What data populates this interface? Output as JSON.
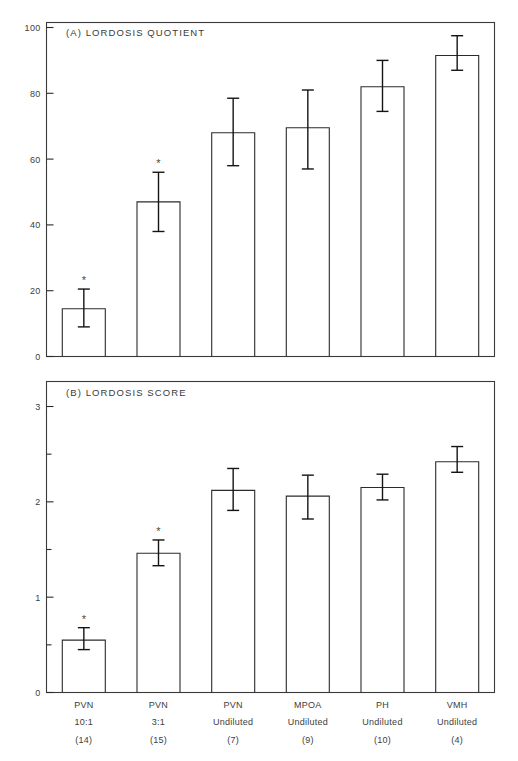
{
  "figure": {
    "background": "#ffffff",
    "ink_color": "#2b2b2b"
  },
  "chart_data": [
    {
      "type": "bar",
      "panel": "A",
      "title": "(A) LORDOSIS QUOTIENT",
      "xlabel": "",
      "ylabel": "",
      "ylim": [
        0,
        105
      ],
      "yticks": [
        0,
        20,
        40,
        60,
        80,
        100
      ],
      "ytick_labels": [
        "0",
        "20",
        "40",
        "60",
        "80",
        "100"
      ],
      "grid": false,
      "legend": "none",
      "categories": [
        "PVN 10:1",
        "PVN 3:1",
        "PVN Undiluted",
        "MPOA Undiluted",
        "PH Undiluted",
        "VMH Undiluted"
      ],
      "values": [
        14.5,
        47.0,
        68.0,
        69.5,
        82.0,
        91.5
      ],
      "errors_upper": [
        20.5,
        56.0,
        78.5,
        81.0,
        90.0,
        97.5
      ],
      "errors_lower": [
        9.0,
        38.0,
        58.0,
        57.0,
        74.5,
        87.0
      ],
      "significance": [
        "*",
        "*",
        "",
        "",
        "",
        ""
      ]
    },
    {
      "type": "bar",
      "panel": "B",
      "title": "(B) LORDOSIS SCORE",
      "xlabel": "",
      "ylabel": "",
      "ylim": [
        0,
        3.2
      ],
      "yticks": [
        0,
        1,
        2,
        3
      ],
      "ytick_labels": [
        "0",
        "1",
        "2",
        "3"
      ],
      "yticks_minor": [
        0.5,
        1.5,
        2.5
      ],
      "grid": false,
      "legend": "none",
      "categories": [
        "PVN 10:1",
        "PVN 3:1",
        "PVN Undiluted",
        "MPOA Undiluted",
        "PH Undiluted",
        "VMH Undiluted"
      ],
      "values": [
        0.55,
        1.46,
        2.12,
        2.06,
        2.15,
        2.42
      ],
      "errors_upper": [
        0.68,
        1.6,
        2.35,
        2.28,
        2.29,
        2.58
      ],
      "errors_lower": [
        0.45,
        1.33,
        1.91,
        1.82,
        2.02,
        2.31
      ],
      "significance": [
        "*",
        "*",
        "",
        "",
        "",
        ""
      ]
    }
  ],
  "xaxis": {
    "groups": [
      {
        "site": "PVN",
        "dilution": "10:1",
        "n": "(14)"
      },
      {
        "site": "PVN",
        "dilution": "3:1",
        "n": "(15)"
      },
      {
        "site": "PVN",
        "dilution": "Undiluted",
        "n": "(7)"
      },
      {
        "site": "MPOA",
        "dilution": "Undiluted",
        "n": "(9)"
      },
      {
        "site": "PH",
        "dilution": "Undiluted",
        "n": "(10)"
      },
      {
        "site": "VMH",
        "dilution": "Undiluted",
        "n": "(4)"
      }
    ]
  }
}
